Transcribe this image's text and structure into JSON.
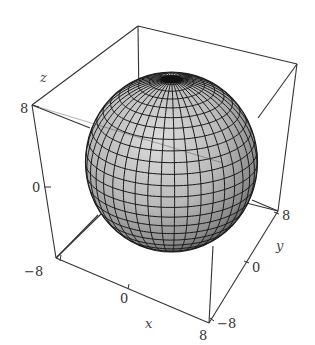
{
  "chart_data": {
    "type": "surface3d",
    "title": "",
    "surface": "sphere",
    "equation": "x^2 + y^2 + z^2 = 64",
    "radius": 8,
    "center": [
      0,
      0,
      0
    ],
    "mesh": {
      "latitude_lines": 24,
      "longitude_lines": 40
    },
    "axes": {
      "x": {
        "label": "x",
        "range": [
          -8,
          8
        ],
        "ticks": [
          "-8",
          "0",
          "8"
        ]
      },
      "y": {
        "label": "y",
        "range": [
          -8,
          8
        ],
        "ticks": [
          "-8",
          "0",
          "8"
        ]
      },
      "z": {
        "label": "z",
        "range": [
          -8,
          8
        ],
        "ticks": [
          "0",
          "8"
        ]
      }
    },
    "box": true,
    "grid": false,
    "legend": null
  },
  "labels": {
    "z_name": "z",
    "z_tick_8": "8",
    "z_tick_0": "0",
    "x_tick_min": "−8",
    "x_tick_0": "0",
    "x_tick_max": "8",
    "x_name": "x",
    "y_tick_min": "−8",
    "y_tick_0": "0",
    "y_tick_max": "8",
    "y_name": "y"
  },
  "colors": {
    "surface_light": "#d6d6d6",
    "surface_mid": "#a9a9a9",
    "surface_dark": "#555555",
    "mesh": "#1a1a1a",
    "box": "#333333"
  }
}
